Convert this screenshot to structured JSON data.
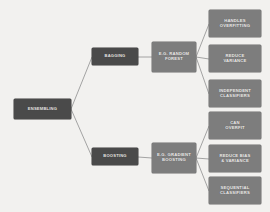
{
  "diagram": {
    "type": "tree",
    "background_color": "#f2f1ef",
    "connector_color": "#8e8e8e",
    "node_colors": {
      "level1": "#4a4a4a",
      "level2": "#4a4a4a",
      "level3": "#7d7d7d",
      "leaf": "#7d7d7d"
    },
    "nodes": {
      "root": {
        "label": "ENSEMBLING",
        "level": 1
      },
      "bagging": {
        "label": "BAGGING",
        "level": 2
      },
      "boosting": {
        "label": "BOOSTING",
        "level": 2
      },
      "random_forest": {
        "label": "E.G. RANDOM\nFOREST",
        "level": 3
      },
      "gradient_boosting": {
        "label": "E.G. GRADIENT\nBOOSTING",
        "level": 3
      },
      "handles_overfitting": {
        "label": "HANDLES\nOVERFITTING",
        "level": 4
      },
      "reduce_variance": {
        "label": "REDUCE\nVARIANCE",
        "level": 4
      },
      "independent_classifiers": {
        "label": "INDEPENDENT\nCLASSIFIERS",
        "level": 4
      },
      "can_overfit": {
        "label": "CAN\nOVERFIT",
        "level": 4
      },
      "reduce_bias_variance": {
        "label": "REDUCE BIAS\n& VARIANCE",
        "level": 4
      },
      "sequential_classifiers": {
        "label": "SEQUENTIAL\nCLASSIFIERS",
        "level": 4
      }
    },
    "edges": [
      {
        "from": "root",
        "to": "bagging"
      },
      {
        "from": "root",
        "to": "boosting"
      },
      {
        "from": "bagging",
        "to": "random_forest"
      },
      {
        "from": "boosting",
        "to": "gradient_boosting"
      },
      {
        "from": "random_forest",
        "to": "handles_overfitting"
      },
      {
        "from": "random_forest",
        "to": "reduce_variance"
      },
      {
        "from": "random_forest",
        "to": "independent_classifiers"
      },
      {
        "from": "gradient_boosting",
        "to": "can_overfit"
      },
      {
        "from": "gradient_boosting",
        "to": "reduce_bias_variance"
      },
      {
        "from": "gradient_boosting",
        "to": "sequential_classifiers"
      }
    ]
  }
}
